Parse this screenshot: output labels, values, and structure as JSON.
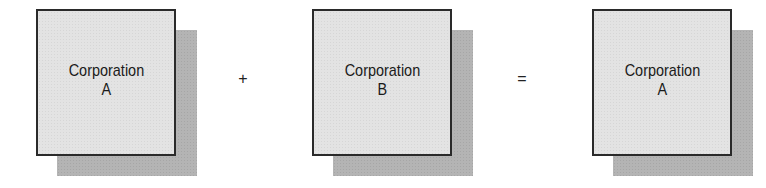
{
  "diagram": {
    "type": "merger-equation",
    "colors": {
      "box_fill": "#e3e3e3",
      "box_border": "#2a2a2a",
      "shadow": "#b4b4b4",
      "background": "#ffffff"
    },
    "boxes": [
      {
        "line1": "Corporation",
        "line2": "A"
      },
      {
        "line1": "Corporation",
        "line2": "B"
      },
      {
        "line1": "Corporation",
        "line2": "A"
      }
    ],
    "operators": {
      "plus": "+",
      "equals": "="
    }
  }
}
